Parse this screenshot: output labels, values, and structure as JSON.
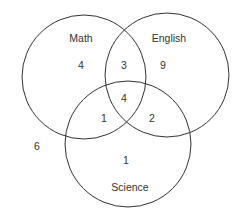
{
  "diagram": {
    "type": "venn",
    "stroke_color": "#333333",
    "background": "#ffffff",
    "sets": [
      {
        "id": "math",
        "label": "Math"
      },
      {
        "id": "english",
        "label": "English"
      },
      {
        "id": "science",
        "label": "Science"
      }
    ],
    "regions": {
      "math_only": "4",
      "english_only": "9",
      "science_only": "1",
      "math_english_only": "3",
      "math_science_only": "1",
      "english_science_only": "2",
      "all_three": "4",
      "outside": "6"
    }
  }
}
